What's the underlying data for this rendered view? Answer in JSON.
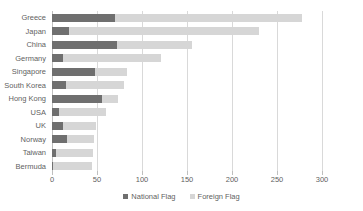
{
  "chart_data": {
    "type": "bar",
    "orientation": "horizontal",
    "stacked": true,
    "title": "",
    "xlabel": "",
    "ylabel": "",
    "xlim": [
      0,
      300
    ],
    "xticks": [
      0,
      50,
      100,
      150,
      200,
      250,
      300
    ],
    "grid": true,
    "legend_position": "bottom",
    "categories": [
      "Greece",
      "Japan",
      "China",
      "Germany",
      "Singapore",
      "South Korea",
      "Hong Kong",
      "USA",
      "UK",
      "Norway",
      "Taiwan",
      "Bermuda"
    ],
    "series": [
      {
        "name": "National Flag",
        "color": "#6f6f6f",
        "values": [
          70,
          19,
          72,
          12,
          48,
          16,
          55,
          8,
          12,
          17,
          4,
          1
        ]
      },
      {
        "name": "Foreign Flag",
        "color": "#d6d6d6",
        "values": [
          208,
          211,
          84,
          109,
          35,
          64,
          18,
          52,
          37,
          30,
          42,
          43
        ]
      }
    ],
    "totals": [
      278,
      230,
      156,
      121,
      83,
      80,
      73,
      60,
      49,
      47,
      46,
      44
    ]
  },
  "legend": {
    "items": [
      {
        "label": "National Flag",
        "swatch": "swatch-national"
      },
      {
        "label": "Foreign Flag",
        "swatch": "swatch-foreign"
      }
    ]
  }
}
